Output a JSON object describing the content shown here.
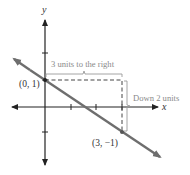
{
  "diagram": {
    "axes": {
      "x_label": "x",
      "y_label": "y"
    },
    "points": [
      {
        "label": "(0, 1)",
        "x": 0,
        "y": 1
      },
      {
        "label": "(3, −1)",
        "x": 3,
        "y": -1
      }
    ],
    "annotations": {
      "horizontal": "3 units to the right",
      "vertical": "Down 2 units"
    },
    "line": {
      "slope": "-2/3",
      "y_intercept": 1
    },
    "colors": {
      "line": "#6e6e6e",
      "axes": "#222222",
      "annotation": "#8a8a8a",
      "dashed": "#444444"
    }
  }
}
